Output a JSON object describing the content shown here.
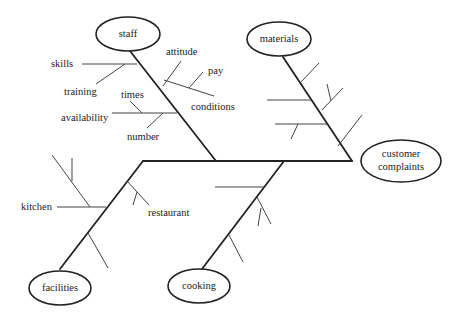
{
  "diagram": {
    "type": "fishbone",
    "effect": "customer\ncomplaints",
    "effect_lines": [
      "customer",
      "complaints"
    ],
    "categories": [
      {
        "name": "staff",
        "causes": [
          "skills",
          "training",
          "attitude",
          "pay",
          "conditions",
          "times",
          "availability",
          "number"
        ]
      },
      {
        "name": "materials",
        "causes": []
      },
      {
        "name": "facilities",
        "causes": [
          "kitchen",
          "restaurant"
        ]
      },
      {
        "name": "cooking",
        "causes": []
      }
    ]
  },
  "labels": {
    "staff": "staff",
    "materials": "materials",
    "facilities": "facilities",
    "cooking": "cooking",
    "effect_line1": "customer",
    "effect_line2": "complaints",
    "skills": "skills",
    "training": "training",
    "attitude": "attitude",
    "pay": "pay",
    "conditions": "conditions",
    "times": "times",
    "availability": "availability",
    "number": "number",
    "kitchen": "kitchen",
    "restaurant": "restaurant"
  },
  "colors": {
    "line": "#222222",
    "background": "#ffffff"
  }
}
